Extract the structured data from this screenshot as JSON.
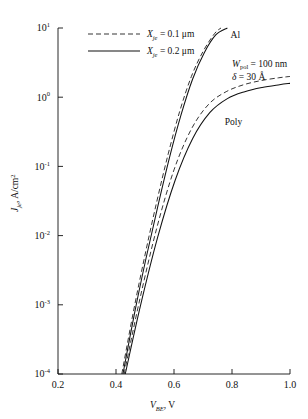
{
  "chart_data": {
    "type": "line",
    "title": "",
    "xlabel": "V_BE, V",
    "ylabel": "J_je, A/cm2",
    "xlabel_parts": {
      "var": "V",
      "sub": "BE",
      "tail": ", V"
    },
    "ylabel_parts": {
      "var": "J",
      "sub": "je",
      "tail": ", A/cm",
      "sup": "2"
    },
    "xlim": [
      0.2,
      1.0
    ],
    "ylim_log": [
      -4,
      1
    ],
    "xticks": [
      "0.2",
      "0.4",
      "0.6",
      "0.8",
      "1.0"
    ],
    "xtick_values": [
      0.2,
      0.4,
      0.6,
      0.8,
      1.0
    ],
    "yticks": [
      {
        "mantissa": "10",
        "exp": "1"
      },
      {
        "mantissa": "10",
        "exp": "0"
      },
      {
        "mantissa": "10",
        "exp": "-1"
      },
      {
        "mantissa": "10",
        "exp": "-2"
      },
      {
        "mantissa": "10",
        "exp": "-3"
      },
      {
        "mantissa": "10",
        "exp": "-4"
      }
    ],
    "ytick_exponents": [
      1,
      0,
      -1,
      -2,
      -3,
      -4
    ],
    "grid": false,
    "legend_position": "top-left",
    "series": [
      {
        "name": "Al, Xje = 0.1 um",
        "style": "dashed",
        "contact": "Al",
        "points_v": [
          0.42,
          0.46,
          0.5,
          0.54,
          0.58,
          0.62,
          0.66,
          0.7,
          0.74,
          0.762
        ],
        "points_logj": [
          -4.0,
          -3.1,
          -2.28,
          -1.52,
          -0.82,
          -0.2,
          0.3,
          0.66,
          0.92,
          1.0
        ]
      },
      {
        "name": "Al, Xje = 0.2 um",
        "style": "solid",
        "contact": "Al",
        "points_v": [
          0.424,
          0.464,
          0.504,
          0.544,
          0.584,
          0.624,
          0.664,
          0.704,
          0.744,
          0.784
        ],
        "points_logj": [
          -4.0,
          -3.12,
          -2.32,
          -1.58,
          -0.88,
          -0.26,
          0.26,
          0.64,
          0.9,
          1.0
        ]
      },
      {
        "name": "Poly, Xje = 0.1 um",
        "style": "dashed",
        "contact": "Poly",
        "points_v": [
          0.428,
          0.48,
          0.54,
          0.6,
          0.66,
          0.72,
          0.78,
          0.84,
          0.9,
          0.96,
          1.0
        ],
        "points_logj": [
          -4.0,
          -2.96,
          -1.9,
          -1.05,
          -0.46,
          -0.1,
          0.08,
          0.18,
          0.24,
          0.28,
          0.3
        ]
      },
      {
        "name": "Poly, Xje = 0.2 um",
        "style": "solid",
        "contact": "Poly",
        "points_v": [
          0.432,
          0.484,
          0.544,
          0.604,
          0.664,
          0.724,
          0.784,
          0.844,
          0.904,
          0.964,
          1.0
        ],
        "points_logj": [
          -4.0,
          -3.02,
          -2.02,
          -1.2,
          -0.6,
          -0.22,
          -0.02,
          0.08,
          0.14,
          0.18,
          0.2
        ]
      }
    ],
    "annotations": [
      {
        "id": "al-label",
        "text": "Al",
        "v": 0.795,
        "logj": 0.86
      },
      {
        "id": "poly-label",
        "text": "Poly",
        "v": 0.775,
        "logj": -0.4
      },
      {
        "id": "wpol-line",
        "var": "W",
        "sub": "pol",
        "tail": " = 100 nm",
        "v": 0.8,
        "logj": 0.44
      },
      {
        "id": "delta-line",
        "var": "δ",
        "sub": "",
        "tail": " = 30 Å",
        "v": 0.8,
        "logj": 0.25
      }
    ],
    "legend": [
      {
        "style": "dashed",
        "var": "X",
        "sub": "je",
        "tail": " = 0.1 μm"
      },
      {
        "style": "solid",
        "var": "X",
        "sub": "je",
        "tail": " = 0.2 μm"
      }
    ]
  }
}
